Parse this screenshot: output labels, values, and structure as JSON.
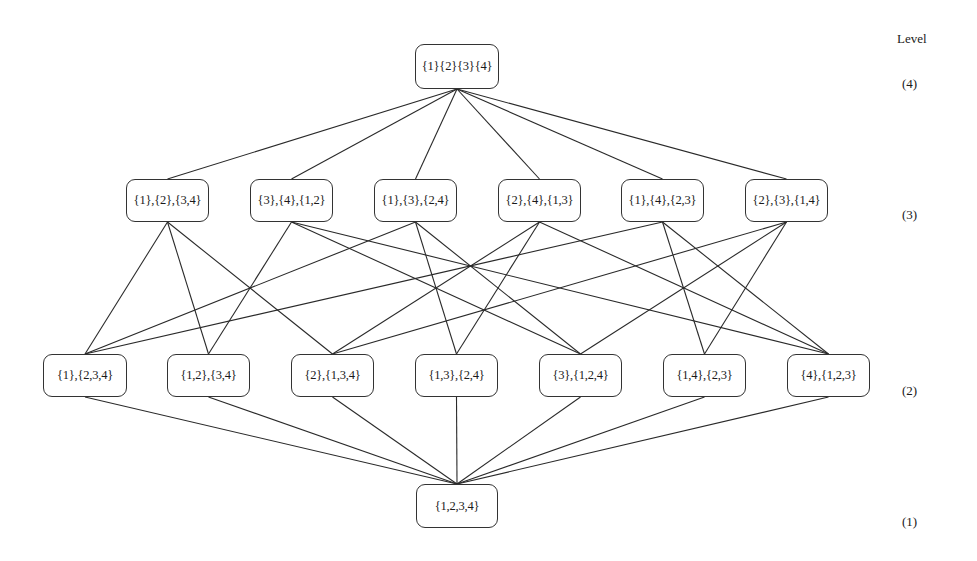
{
  "diagram": {
    "level_header": "Level",
    "levels": [
      {
        "label": "(4)",
        "y": 84
      },
      {
        "label": "(3)",
        "y": 215
      },
      {
        "label": "(2)",
        "y": 391
      },
      {
        "label": "(1)",
        "y": 522
      }
    ],
    "nodes": [
      {
        "id": "n4",
        "label": "{1}{2}{3}{4}",
        "level": 4,
        "x": 415,
        "y": 44,
        "w": 84,
        "h": 45
      },
      {
        "id": "a",
        "label": "{1},{2},{3,4}",
        "level": 3,
        "x": 126,
        "y": 179,
        "w": 83,
        "h": 43
      },
      {
        "id": "b",
        "label": "{3},{4},{1,2}",
        "level": 3,
        "x": 250,
        "y": 179,
        "w": 83,
        "h": 43
      },
      {
        "id": "c",
        "label": "{1},{3},{2,4}",
        "level": 3,
        "x": 374,
        "y": 179,
        "w": 83,
        "h": 43
      },
      {
        "id": "d",
        "label": "{2},{4},{1,3}",
        "level": 3,
        "x": 498,
        "y": 179,
        "w": 83,
        "h": 43
      },
      {
        "id": "e",
        "label": "{1},{4},{2,3}",
        "level": 3,
        "x": 621,
        "y": 179,
        "w": 83,
        "h": 43
      },
      {
        "id": "f",
        "label": "{2},{3},{1,4}",
        "level": 3,
        "x": 745,
        "y": 179,
        "w": 83,
        "h": 43
      },
      {
        "id": "p",
        "label": "{1},{2,3,4}",
        "level": 2,
        "x": 43,
        "y": 354,
        "w": 84,
        "h": 43
      },
      {
        "id": "q",
        "label": "{1,2},{3,4}",
        "level": 2,
        "x": 167,
        "y": 354,
        "w": 83,
        "h": 43
      },
      {
        "id": "r",
        "label": "{2},{1,3,4}",
        "level": 2,
        "x": 291,
        "y": 354,
        "w": 83,
        "h": 43
      },
      {
        "id": "s",
        "label": "{1,3},{2,4}",
        "level": 2,
        "x": 415,
        "y": 354,
        "w": 83,
        "h": 43
      },
      {
        "id": "t",
        "label": "{3},{1,2,4}",
        "level": 2,
        "x": 539,
        "y": 354,
        "w": 83,
        "h": 43
      },
      {
        "id": "u",
        "label": "{1,4},{2,3}",
        "level": 2,
        "x": 663,
        "y": 354,
        "w": 83,
        "h": 43
      },
      {
        "id": "v",
        "label": "{4},{1,2,3}",
        "level": 2,
        "x": 787,
        "y": 354,
        "w": 83,
        "h": 43
      },
      {
        "id": "n1",
        "label": "{1,2,3,4}",
        "level": 1,
        "x": 416,
        "y": 484,
        "w": 82,
        "h": 44
      }
    ],
    "edges": [
      [
        "n4",
        "a"
      ],
      [
        "n4",
        "b"
      ],
      [
        "n4",
        "c"
      ],
      [
        "n4",
        "d"
      ],
      [
        "n4",
        "e"
      ],
      [
        "n4",
        "f"
      ],
      [
        "a",
        "p"
      ],
      [
        "a",
        "q"
      ],
      [
        "a",
        "r"
      ],
      [
        "b",
        "q"
      ],
      [
        "b",
        "t"
      ],
      [
        "b",
        "v"
      ],
      [
        "c",
        "p"
      ],
      [
        "c",
        "s"
      ],
      [
        "c",
        "t"
      ],
      [
        "d",
        "r"
      ],
      [
        "d",
        "s"
      ],
      [
        "d",
        "v"
      ],
      [
        "e",
        "p"
      ],
      [
        "e",
        "u"
      ],
      [
        "e",
        "v"
      ],
      [
        "f",
        "r"
      ],
      [
        "f",
        "t"
      ],
      [
        "f",
        "u"
      ],
      [
        "p",
        "n1"
      ],
      [
        "q",
        "n1"
      ],
      [
        "r",
        "n1"
      ],
      [
        "s",
        "n1"
      ],
      [
        "t",
        "n1"
      ],
      [
        "u",
        "n1"
      ],
      [
        "v",
        "n1"
      ]
    ]
  }
}
